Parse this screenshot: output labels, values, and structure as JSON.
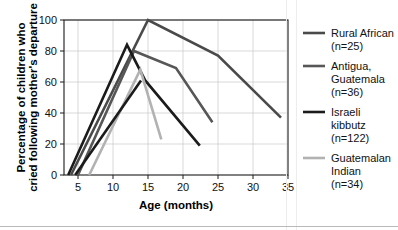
{
  "chart_data": {
    "type": "line",
    "title": "",
    "xlabel": "Age (months)",
    "ylabel": "Percentage of children who cried following mother's departure",
    "xlim": [
      3,
      35
    ],
    "ylim": [
      0,
      100
    ],
    "xticks": [
      5,
      10,
      15,
      20,
      25,
      30,
      35
    ],
    "yticks": [
      0,
      20,
      40,
      60,
      80,
      100
    ],
    "grid": true,
    "legend_position": "right",
    "series": [
      {
        "name": "Rural African",
        "label_lines": [
          "Rural African",
          "(n=25)"
        ],
        "n": 25,
        "color": "#4a4a4a",
        "width": 2.6,
        "points": [
          [
            4.0,
            0
          ],
          [
            15.0,
            100
          ],
          [
            25.0,
            77
          ],
          [
            34.0,
            37
          ]
        ]
      },
      {
        "name": "Antigua, Guatemala",
        "label_lines": [
          "Antigua,",
          "Guatemala",
          "(n=36)"
        ],
        "n": 36,
        "color": "#575757",
        "width": 2.6,
        "points": [
          [
            5.0,
            0
          ],
          [
            13.0,
            80
          ],
          [
            19.0,
            69
          ],
          [
            24.2,
            34
          ]
        ]
      },
      {
        "name": "Israeli kibbutz",
        "label_lines": [
          "Israeli",
          "kibbutz",
          "(n=122)"
        ],
        "n": 122,
        "color": "#1b1b1b",
        "width": 2.6,
        "points": [
          [
            3.6,
            0
          ],
          [
            12.0,
            84
          ],
          [
            14.6,
            61
          ],
          [
            22.4,
            19
          ]
        ]
      },
      {
        "name": "Guatemalan Indian",
        "label_lines": [
          "Guatemalan",
          "Indian",
          "(n=34)"
        ],
        "n": 34,
        "color": "#b2b2b2",
        "width": 2.6,
        "points": [
          [
            6.6,
            0
          ],
          [
            13.9,
            68
          ],
          [
            16.9,
            23
          ]
        ]
      }
    ],
    "extra_segments": [
      {
        "name": "Israeli kibbutz secondary",
        "color": "#1b1b1b",
        "width": 2.6,
        "points": [
          [
            4.6,
            0
          ],
          [
            14.0,
            61
          ]
        ]
      }
    ]
  },
  "legend": {
    "entries": [
      {
        "label1": "Rural African",
        "label2": "(n=25)",
        "label3": ""
      },
      {
        "label1": "Antigua,",
        "label2": "Guatemala",
        "label3": "(n=36)"
      },
      {
        "label1": "Israeli",
        "label2": "kibbutz",
        "label3": "(n=122)"
      },
      {
        "label1": "Guatemalan",
        "label2": "Indian",
        "label3": "(n=34)"
      }
    ]
  },
  "axis": {
    "x_title": "Age (months)",
    "y_title_line1": "Percentage of children who",
    "y_title_line2": "cried following mother's departure",
    "x_tick_labels": [
      "5",
      "10",
      "15",
      "20",
      "25",
      "30",
      "35"
    ],
    "y_tick_labels": [
      "0",
      "20",
      "40",
      "60",
      "80",
      "100"
    ]
  }
}
